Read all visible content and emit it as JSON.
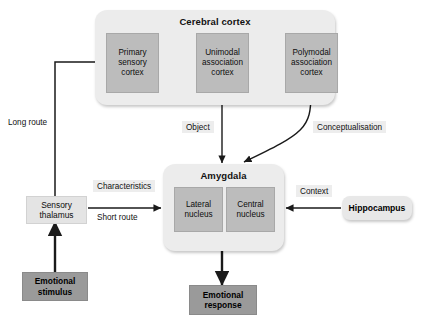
{
  "diagram": {
    "colors": {
      "background": "#ffffff",
      "panel_fill": "#ececec",
      "subbox_fill": "#bcbcbc",
      "node_light_fill": "#e4e4e4",
      "node_dark_fill": "#9a9a9a",
      "label_fill": "#ededed",
      "arrow": "#1a1a1a"
    }
  },
  "cortex": {
    "title": "Cerebral cortex",
    "boxes": [
      {
        "label": "Primary sensory cortex"
      },
      {
        "label": "Unimodal association cortex"
      },
      {
        "label": "Polymodal association cortex"
      }
    ]
  },
  "amygdala": {
    "title": "Amygdala",
    "boxes": [
      {
        "label": "Lateral nucleus"
      },
      {
        "label": "Central nucleus"
      }
    ]
  },
  "nodes": {
    "sensory_thalamus": "Sensory thalamus",
    "emotional_stimulus": "Emotional stimulus",
    "emotional_response": "Emotional response",
    "hippocampus": "Hippocampus"
  },
  "edge_labels": {
    "long_route": "Long route",
    "short_route": "Short route",
    "characteristics": "Characteristics",
    "object": "Object",
    "conceptualisation": "Conceptualisation",
    "context": "Context"
  }
}
